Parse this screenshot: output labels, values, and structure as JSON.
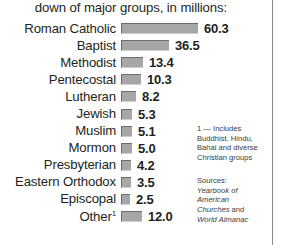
{
  "headline": "down of major groups, in millions:",
  "chart_data": {
    "type": "bar",
    "title": "down of major groups, in millions:",
    "xlabel": "",
    "ylabel": "",
    "units": "millions",
    "orientation": "horizontal",
    "grid": false,
    "legend": null,
    "categories": [
      "Roman Catholic",
      "Baptist",
      "Methodist",
      "Pentecostal",
      "Lutheran",
      "Jewish",
      "Muslim",
      "Mormon",
      "Presbyterian",
      "Eastern Orthodox",
      "Episcopal",
      "Other"
    ],
    "values": [
      60.3,
      36.5,
      13.4,
      10.3,
      8.2,
      5.3,
      5.1,
      5.0,
      4.2,
      3.5,
      2.5,
      12.0
    ],
    "value_labels": [
      "60.3",
      "36.5",
      "13.4",
      "10.3",
      "8.2",
      "5.3",
      "5.1",
      "5.0",
      "4.2",
      "3.5",
      "2.5",
      "12.0"
    ],
    "xlim": [
      0,
      60.3
    ],
    "bar_color": "#a7a7a7",
    "bar_edge_color": "#6d6d6d"
  },
  "rows": [
    {
      "label": "Roman Catholic",
      "value": "60.3",
      "bar_px": 77,
      "footnote": ""
    },
    {
      "label": "Baptist",
      "value": "36.5",
      "bar_px": 48,
      "footnote": ""
    },
    {
      "label": "Methodist",
      "value": "13.4",
      "bar_px": 22,
      "footnote": ""
    },
    {
      "label": "Pentecostal",
      "value": "10.3",
      "bar_px": 20,
      "footnote": ""
    },
    {
      "label": "Lutheran",
      "value": "8.2",
      "bar_px": 15,
      "footnote": ""
    },
    {
      "label": "Jewish",
      "value": "5.3",
      "bar_px": 11,
      "footnote": ""
    },
    {
      "label": "Muslim",
      "value": "5.1",
      "bar_px": 11,
      "footnote": ""
    },
    {
      "label": "Mormon",
      "value": "5.0",
      "bar_px": 11,
      "footnote": ""
    },
    {
      "label": "Presbyterian",
      "value": "4.2",
      "bar_px": 10,
      "footnote": ""
    },
    {
      "label": "Eastern Orthodox",
      "value": "3.5",
      "bar_px": 10,
      "footnote": ""
    },
    {
      "label": "Episcopal",
      "value": "2.5",
      "bar_px": 9,
      "footnote": ""
    },
    {
      "label": "Other",
      "value": "12.0",
      "bar_px": 21,
      "footnote": "1"
    }
  ],
  "notes": {
    "footnote": "1 — Includes Buddhist, Hindu, Bahai and diverse Christian groups",
    "sources_title": "Sources:",
    "sources_line1": "Yearbook of",
    "sources_line2": "American",
    "sources_line3": "Churches",
    "sources_and": " and",
    "sources_line4": "World Almanac"
  },
  "colors": {
    "text": "#231f20",
    "bar_fill": "#a7a7a7",
    "bar_edge": "#6d6d6d",
    "rule": "#8d8d8d",
    "background": "#ffffff"
  }
}
